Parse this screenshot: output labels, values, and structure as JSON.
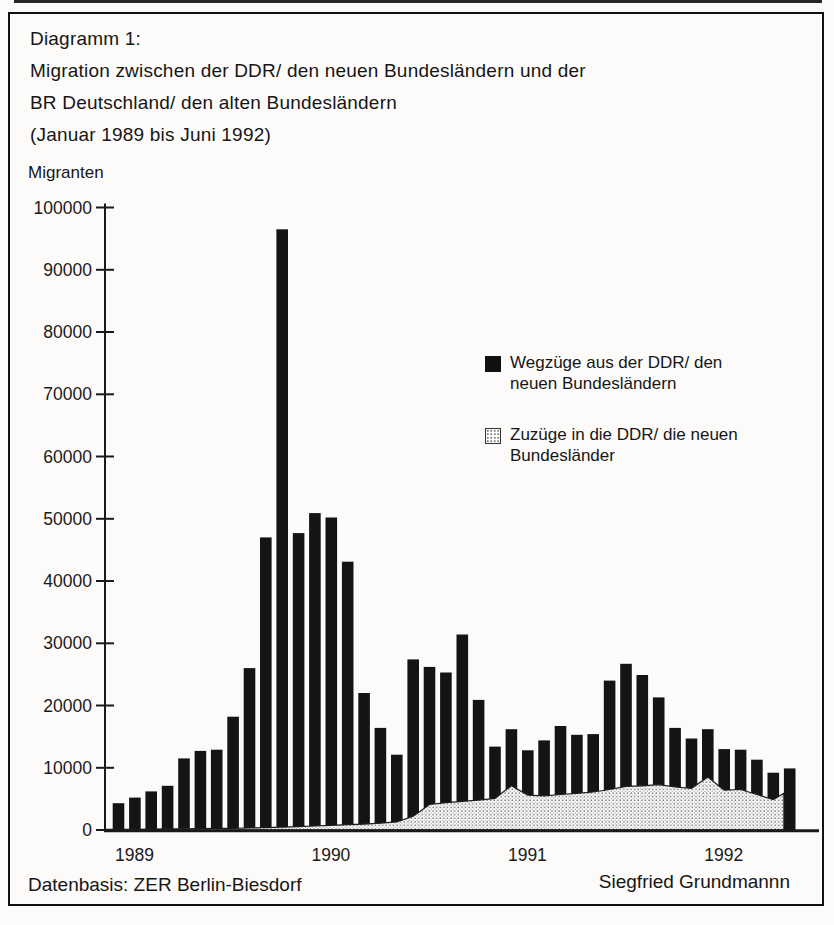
{
  "header": {
    "line1": "Diagramm 1:",
    "line2": "Migration zwischen der DDR/ den neuen Bundesländern und der",
    "line3": "BR Deutschland/ den alten Bundesländern",
    "line4": "(Januar 1989 bis Juni 1992)"
  },
  "axis": {
    "y_unit_label": "Migranten"
  },
  "legend": {
    "items": [
      {
        "swatch": "black-solid",
        "lines": [
          "Wegzüge aus der DDR/ den",
          "neuen Bundesländern"
        ]
      },
      {
        "swatch": "dotted-light",
        "lines": [
          "Zuzüge in die DDR/ die neuen",
          "Bundesländer"
        ]
      }
    ]
  },
  "footer": {
    "left": "Datenbasis: ZER Berlin-Biesdorf",
    "right": "Siegfried Grundmannn"
  },
  "colors": {
    "bar": "#141414",
    "ink": "#1a1a1a",
    "paper": "#fcfbf9",
    "area_dot": "#6a6a6a"
  },
  "chart_data": {
    "type": "bar",
    "title": "Migration zwischen der DDR/ den neuen Bundesländern und der BR Deutschland/ den alten Bundesländern (Januar 1989 bis Juni 1992)",
    "xlabel": "",
    "ylabel": "Migranten",
    "ylim": [
      0,
      100000
    ],
    "ytick_step": 10000,
    "grid": false,
    "legend_position": "center-right",
    "categories": [
      "1989-01",
      "1989-02",
      "1989-03",
      "1989-04",
      "1989-05",
      "1989-06",
      "1989-07",
      "1989-08",
      "1989-09",
      "1989-10",
      "1989-11",
      "1989-12",
      "1990-01",
      "1990-02",
      "1990-03",
      "1990-04",
      "1990-05",
      "1990-06",
      "1990-07",
      "1990-08",
      "1990-09",
      "1990-10",
      "1990-11",
      "1990-12",
      "1991-01",
      "1991-02",
      "1991-03",
      "1991-04",
      "1991-05",
      "1991-06",
      "1991-07",
      "1991-08",
      "1991-09",
      "1991-10",
      "1991-11",
      "1991-12",
      "1992-01",
      "1992-02",
      "1992-03",
      "1992-04",
      "1992-05",
      "1992-06"
    ],
    "x_year_labels": [
      "1989",
      "1990",
      "1991",
      "1992"
    ],
    "x_year_label_month_index": [
      0,
      12,
      24,
      36
    ],
    "series": [
      {
        "name": "Wegzüge aus der DDR/ den neuen Bundesländern",
        "type": "bar",
        "values": [
          4300,
          5200,
          6200,
          7100,
          11500,
          12700,
          12900,
          18200,
          26000,
          47000,
          96500,
          47700,
          50900,
          50200,
          43100,
          22000,
          16400,
          12100,
          27400,
          26200,
          25300,
          31400,
          20900,
          13400,
          16200,
          12800,
          14400,
          16700,
          15300,
          15400,
          24000,
          26700,
          24900,
          21300,
          16400,
          14700,
          16200,
          13000,
          12900,
          11300,
          9200,
          9900
        ]
      },
      {
        "name": "Zuzüge in die DDR/ die neuen Bundesländer",
        "type": "area",
        "values": [
          100,
          120,
          150,
          170,
          200,
          220,
          250,
          280,
          320,
          380,
          450,
          550,
          650,
          750,
          850,
          950,
          1100,
          1300,
          2200,
          4100,
          4400,
          4600,
          4800,
          5100,
          7100,
          5600,
          5500,
          5700,
          5900,
          6100,
          6500,
          7000,
          7100,
          7300,
          6900,
          6700,
          8500,
          6400,
          6500,
          5700,
          4900,
          5900
        ]
      }
    ]
  }
}
